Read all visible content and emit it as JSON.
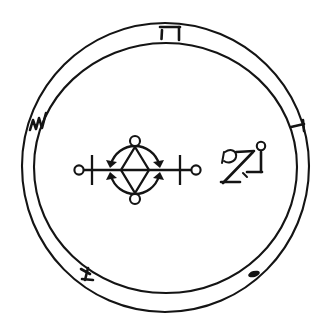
{
  "document": {
    "kind": "occult-seal",
    "title": "Goetic Seal",
    "background_color": "#ffffff",
    "ink_color": "#141414",
    "width": 331,
    "height": 329
  },
  "ring": {
    "name": "double-circle-border",
    "center_x": 165,
    "center_y": 168,
    "outer_radius": 144,
    "inner_radius": 131,
    "stroke_color": "#141414",
    "stroke_width": 2.1
  },
  "ring_glyphs": [
    {
      "id": "glyph-top",
      "name": "hebrew-letter-hei",
      "label": "ה",
      "position": "top",
      "x": 172,
      "y": 33,
      "angle_degrees": 0
    },
    {
      "id": "glyph-left",
      "name": "zigzag-shin-mark",
      "label": "ש",
      "position": "left",
      "x": 38,
      "y": 124,
      "angle_degrees": 255
    },
    {
      "id": "glyph-right",
      "name": "yod-tick-mark",
      "label": "י",
      "position": "right",
      "x": 300,
      "y": 125,
      "angle_degrees": 75
    },
    {
      "id": "glyph-bottom-left",
      "name": "angular-hook-mark",
      "label": "ז",
      "position": "bottom-left",
      "x": 86,
      "y": 274,
      "angle_degrees": 210
    },
    {
      "id": "glyph-bottom-right",
      "name": "dot-dash-mark",
      "label": "·",
      "position": "bottom-right",
      "x": 254,
      "y": 274,
      "angle_degrees": 145
    }
  ],
  "center_sigil": {
    "name": "primary-sigil",
    "axis": {
      "name": "horizontal-axis-line",
      "x_start": 83,
      "x_end": 196,
      "y": 170
    },
    "end_nodes": [
      {
        "name": "left-terminal-circle",
        "cx": 79,
        "cy": 170,
        "r": 4.6
      },
      {
        "name": "right-terminal-circle",
        "cx": 196,
        "cy": 170,
        "r": 4.6
      }
    ],
    "cross_bars": [
      {
        "name": "left-cross-bar",
        "x": 92,
        "y_top": 155,
        "y_bottom": 185
      },
      {
        "name": "right-cross-bar",
        "x": 180,
        "y_top": 155,
        "y_bottom": 185
      }
    ],
    "diamond": {
      "name": "center-diamond",
      "cx": 135,
      "cy": 170,
      "half_width": 14,
      "half_height": 23
    },
    "arcs": [
      {
        "name": "upper-arc",
        "orientation": "up",
        "cx": 135,
        "cy": 170,
        "radius": 25,
        "node": {
          "name": "upper-arc-circle",
          "cx": 135,
          "cy": 141,
          "r": 5.0
        }
      },
      {
        "name": "lower-arc",
        "orientation": "down",
        "cx": 135,
        "cy": 170,
        "radius": 25,
        "node": {
          "name": "lower-arc-circle",
          "cx": 135,
          "cy": 199,
          "r": 5.0
        }
      }
    ]
  },
  "side_sigil": {
    "name": "secondary-sigil-group",
    "x": 218,
    "y": 140,
    "width": 52,
    "height": 50,
    "parts": [
      {
        "name": "hook-curl-glyph",
        "label": "ב"
      },
      {
        "name": "zayin-z-glyph",
        "label": "ז"
      },
      {
        "name": "vav-with-circle-glyph",
        "label": "ו"
      }
    ]
  }
}
